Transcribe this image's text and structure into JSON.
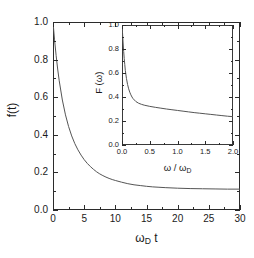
{
  "figure": {
    "background": "#ffffff",
    "line_color": "#555555",
    "axis_color": "#2b2b2b"
  },
  "chart_data": [
    {
      "id": "main",
      "type": "line",
      "title": "",
      "xlabel": "ω_D t",
      "xlabel_base": "ω",
      "xlabel_sub": "D",
      "xlabel_tail": " t",
      "ylabel": "f(t)",
      "xlim": [
        0,
        30
      ],
      "ylim": [
        0.0,
        1.0
      ],
      "xticks": [
        0,
        5,
        10,
        15,
        20,
        25,
        30
      ],
      "xticklabels": [
        "0",
        "5",
        "10",
        "15",
        "20",
        "25",
        "30"
      ],
      "yticks": [
        0.0,
        0.2,
        0.4,
        0.6,
        0.8,
        1.0
      ],
      "yticklabels": [
        "0.0",
        "0.2",
        "0.4",
        "0.6",
        "0.8",
        "1.0"
      ],
      "minor_x_per_major": 1,
      "minor_y_per_major": 1,
      "grid": false,
      "legend": null,
      "series": [
        {
          "name": "f(t)",
          "x": [
            0.0,
            0.25,
            0.5,
            0.75,
            1.0,
            1.5,
            2.0,
            2.5,
            3.0,
            3.5,
            4.0,
            4.5,
            5.0,
            5.5,
            6.0,
            6.5,
            7.0,
            7.5,
            8.0,
            8.5,
            9.0,
            9.5,
            10.0,
            11.0,
            12.0,
            13.0,
            14.0,
            15.0,
            16.0,
            17.0,
            18.0,
            20.0,
            22.0,
            24.0,
            26.0,
            28.0,
            30.0
          ],
          "y": [
            1.0,
            0.905,
            0.822,
            0.75,
            0.687,
            0.585,
            0.506,
            0.444,
            0.394,
            0.353,
            0.32,
            0.292,
            0.268,
            0.248,
            0.231,
            0.216,
            0.203,
            0.192,
            0.183,
            0.175,
            0.168,
            0.162,
            0.157,
            0.148,
            0.14,
            0.134,
            0.13,
            0.126,
            0.123,
            0.121,
            0.119,
            0.116,
            0.114,
            0.113,
            0.112,
            0.111,
            0.111
          ]
        }
      ]
    },
    {
      "id": "inset",
      "type": "line",
      "title": "",
      "xlabel": "ω / ω_D",
      "xlabel_base": "ω / ω",
      "xlabel_sub": "D",
      "ylabel": "F (ω)",
      "xlim": [
        0.0,
        2.0
      ],
      "ylim": [
        0.0,
        1.0
      ],
      "xticks": [
        0.0,
        0.5,
        1.0,
        1.5,
        2.0
      ],
      "xticklabels": [
        "0.0",
        "0.5",
        "1.0",
        "1.5",
        "2.0"
      ],
      "yticks": [
        0.0,
        0.2,
        0.4,
        0.6,
        0.8,
        1.0
      ],
      "yticklabels": [
        "0.0",
        "0.2",
        "0.4",
        "0.6",
        "0.8",
        "1.0"
      ],
      "minor_x_per_major": 1,
      "minor_y_per_major": 1,
      "grid": false,
      "legend": null,
      "series": [
        {
          "name": "F(ω)",
          "x": [
            0.0,
            0.01,
            0.02,
            0.03,
            0.04,
            0.05,
            0.06,
            0.08,
            0.1,
            0.12,
            0.14,
            0.16,
            0.18,
            0.2,
            0.25,
            0.3,
            0.35,
            0.4,
            0.5,
            0.6,
            0.7,
            0.8,
            0.9,
            1.0,
            1.1,
            1.2,
            1.3,
            1.4,
            1.5,
            1.6,
            1.7,
            1.8,
            1.9,
            2.0
          ],
          "y": [
            1.0,
            0.93,
            0.85,
            0.78,
            0.72,
            0.67,
            0.62,
            0.555,
            0.505,
            0.468,
            0.44,
            0.418,
            0.4,
            0.386,
            0.362,
            0.348,
            0.339,
            0.332,
            0.322,
            0.314,
            0.307,
            0.3,
            0.294,
            0.288,
            0.282,
            0.276,
            0.27,
            0.265,
            0.26,
            0.255,
            0.25,
            0.245,
            0.24,
            0.236
          ]
        }
      ]
    }
  ]
}
